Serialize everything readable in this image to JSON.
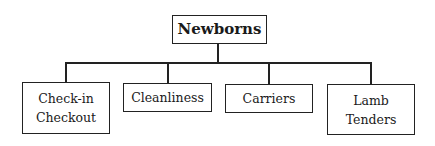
{
  "diagram": {
    "type": "org-chart",
    "root": {
      "label": "Newborns"
    },
    "children": [
      {
        "lines": [
          "Check-in",
          "Checkout"
        ]
      },
      {
        "lines": [
          "Cleanliness"
        ]
      },
      {
        "lines": [
          "Carriers"
        ]
      },
      {
        "lines": [
          "Lamb",
          "Tenders"
        ]
      }
    ],
    "colors": {
      "line": "#222222",
      "background": "#ffffff",
      "text": "#1a1a1a"
    }
  }
}
